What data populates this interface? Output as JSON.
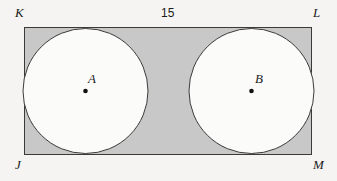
{
  "figure": {
    "name": "rectangle-with-two-inscribed-circles",
    "background_color": "#f5f4f2",
    "stroke_color": "#3a3a3a",
    "rectangle": {
      "name": "JKLM",
      "fill_color": "#c8c8c8",
      "x": 24,
      "y": 27,
      "width": 288,
      "height": 128,
      "vertices": [
        {
          "id": "K",
          "label": "K",
          "position": "top-left"
        },
        {
          "id": "L",
          "label": "L",
          "position": "top-right"
        },
        {
          "id": "J",
          "label": "J",
          "position": "bottom-left"
        },
        {
          "id": "M",
          "label": "M",
          "position": "bottom-right"
        }
      ]
    },
    "circles": [
      {
        "id": "A",
        "center_label": "A",
        "fill_color": "#fbfbfa",
        "cx": 85.5,
        "cy": 91,
        "r": 63,
        "dot_color": "#111111",
        "dot_r": 2.2
      },
      {
        "id": "B",
        "center_label": "B",
        "fill_color": "#fbfbfa",
        "cx": 251.5,
        "cy": 91,
        "r": 63,
        "dot_color": "#111111",
        "dot_r": 2.2
      }
    ],
    "dimensions": {
      "top_width": "15"
    }
  }
}
